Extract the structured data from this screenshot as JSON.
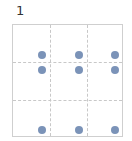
{
  "label": "1",
  "grid": {
    "vlines_px": [
      37,
      74
    ],
    "hlines_px": [
      37,
      75
    ]
  },
  "dot_color": "#7b93b8",
  "dots": [
    {
      "x": 29,
      "y": 30
    },
    {
      "x": 66,
      "y": 30
    },
    {
      "x": 102,
      "y": 30
    },
    {
      "x": 29,
      "y": 45
    },
    {
      "x": 66,
      "y": 45
    },
    {
      "x": 102,
      "y": 45
    },
    {
      "x": 29,
      "y": 105
    },
    {
      "x": 66,
      "y": 105
    },
    {
      "x": 102,
      "y": 105
    }
  ]
}
